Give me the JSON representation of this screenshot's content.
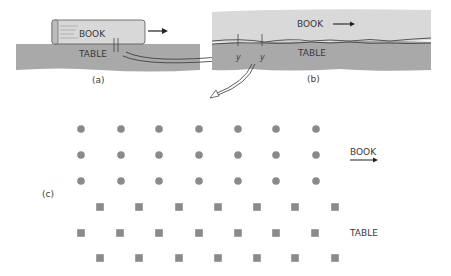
{
  "panel_a": {
    "caption": "(a)",
    "book_label": "BOOK",
    "table_label": "TABLE"
  },
  "panel_b": {
    "caption": "(b)",
    "book_label": "BOOK",
    "table_label": "TABLE",
    "y_label_1": "y",
    "y_label_2": "y"
  },
  "panel_c": {
    "caption": "(c)",
    "book_label": "BOOK",
    "table_label": "TABLE",
    "book_atoms": {
      "shape": "circle",
      "rows": [
        {
          "y": 129,
          "x": [
            81,
            121,
            159,
            199,
            238,
            276,
            316
          ]
        },
        {
          "y": 155,
          "x": [
            81,
            121,
            159,
            199,
            238,
            276,
            316
          ]
        },
        {
          "y": 181,
          "x": [
            81,
            121,
            159,
            199,
            238,
            276,
            316
          ]
        }
      ]
    },
    "table_atoms": {
      "shape": "square",
      "rows": [
        {
          "y": 207,
          "x": [
            100,
            139,
            179,
            218,
            257,
            295,
            335
          ]
        },
        {
          "y": 233,
          "x": [
            81,
            120,
            159,
            199,
            238,
            276,
            315
          ]
        },
        {
          "y": 258,
          "x": [
            100,
            139,
            179,
            218,
            257,
            295,
            335
          ]
        }
      ]
    }
  },
  "colors": {
    "atom": "#8a8a8a",
    "table_surface": "#a9a9a9",
    "book_surface": "#d9d9d9",
    "ink": "#333333"
  }
}
